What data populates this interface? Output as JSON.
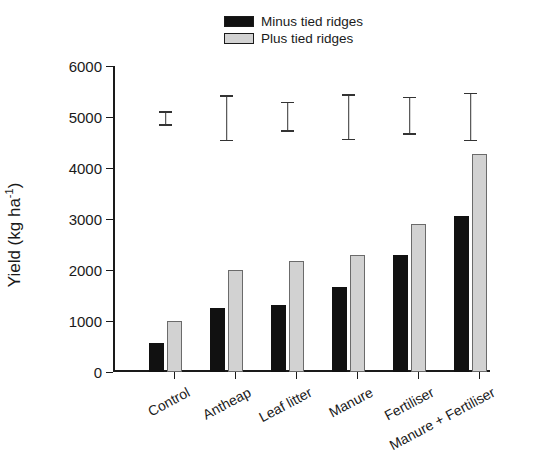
{
  "figure": {
    "y_axis_title_prefix": "Yield (kg ha",
    "y_axis_title_sup": "-1",
    "y_axis_title_suffix": ")",
    "y_axis_title_full": "Yield (kg ha-1)"
  },
  "legend": {
    "items": [
      {
        "label": "Minus tied ridges",
        "color": "#111111",
        "swatch": "black"
      },
      {
        "label": "Plus tied ridges",
        "color": "#d2d2d2",
        "swatch": "gray"
      }
    ]
  },
  "chart_data": {
    "type": "bar",
    "title": "",
    "xlabel": "",
    "ylabel": "Yield (kg ha-1)",
    "ylim": [
      0,
      6000
    ],
    "yticks": [
      0,
      1000,
      2000,
      3000,
      4000,
      5000,
      6000
    ],
    "ytick_labels": [
      "0",
      "1000",
      "2000",
      "3000",
      "4000",
      "5000",
      "6000"
    ],
    "grid": false,
    "legend_position": "top-center",
    "categories": [
      "Control",
      "Antheap",
      "Leaf litter",
      "Manure",
      "Fertiliser",
      "Manure + Fertiliser"
    ],
    "series": [
      {
        "name": "Minus tied ridges",
        "color": "#111111",
        "values": [
          570,
          1250,
          1320,
          1670,
          2290,
          3050
        ]
      },
      {
        "name": "Plus tied ridges",
        "color": "#d2d2d2",
        "values": [
          1000,
          2000,
          2180,
          2300,
          2900,
          4280
        ]
      }
    ],
    "error_bars": {
      "note": "floating LSD bars drawn near y=5000, one per category",
      "values": [
        {
          "category": "Control",
          "low": 4830,
          "high": 5120
        },
        {
          "category": "Antheap",
          "low": 4520,
          "high": 5430
        },
        {
          "category": "Leaf litter",
          "low": 4700,
          "high": 5300
        },
        {
          "category": "Manure",
          "low": 4540,
          "high": 5450
        },
        {
          "category": "Fertiliser",
          "low": 4650,
          "high": 5400
        },
        {
          "category": "Manure + Fertiliser",
          "low": 4520,
          "high": 5480
        }
      ]
    }
  }
}
